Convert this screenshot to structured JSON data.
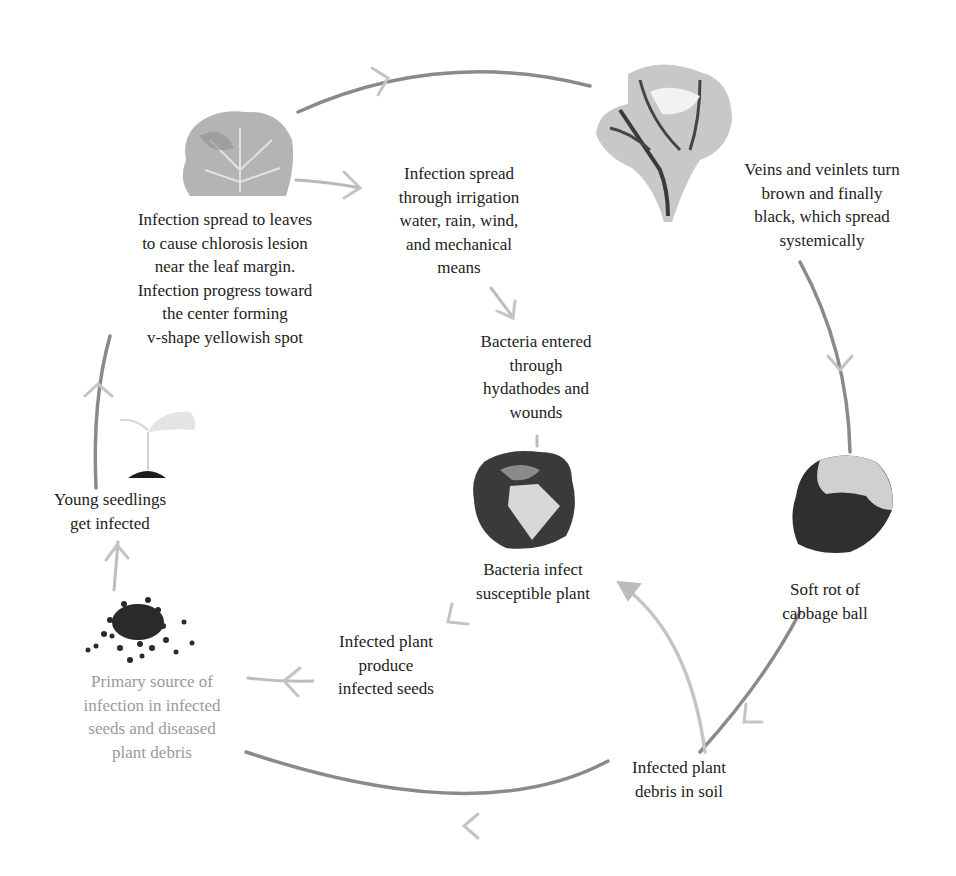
{
  "diagram": {
    "type": "disease-cycle",
    "colors": {
      "arrow_dark": "#7d7d7d",
      "arrow_light": "#bdbdbd",
      "text": "#222222",
      "text_faded": "#9a9a9a"
    },
    "nodes": [
      {
        "id": "leaf-chlorosis",
        "image": "leaf-icon",
        "lines": [
          "Infection spread to leaves",
          "to cause chlorosis lesion",
          "near the leaf margin.",
          "Infection progress toward",
          "the center forming",
          "v-shape yellowish spot"
        ]
      },
      {
        "id": "spread-means",
        "lines": [
          "Infection spread",
          "through irrigation",
          "water, rain, wind,",
          "and mechanical",
          "means"
        ]
      },
      {
        "id": "veins-black",
        "image": "blackened-leaf-icon",
        "lines": [
          "Veins and veinlets turn",
          "brown and finally",
          "black, which spread",
          "systemically"
        ]
      },
      {
        "id": "bacteria-entered",
        "lines": [
          "Bacteria entered",
          "through",
          "hydathodes and",
          "wounds"
        ]
      },
      {
        "id": "bacteria-infect",
        "image": "infected-cabbage-icon",
        "lines": [
          "Bacteria infect",
          "susceptible plant"
        ]
      },
      {
        "id": "soft-rot",
        "image": "rotten-cabbage-icon",
        "lines": [
          "Soft rot of",
          "cabbage ball"
        ]
      },
      {
        "id": "debris-soil",
        "lines": [
          "Infected plant",
          "debris in soil"
        ]
      },
      {
        "id": "infected-seeds",
        "lines": [
          "Infected plant",
          "produce",
          "infected seeds"
        ]
      },
      {
        "id": "primary-source",
        "image": "seeds-icon",
        "lines": [
          "Primary source of",
          "infection in infected",
          "seeds and diseased",
          "plant debris"
        ]
      },
      {
        "id": "young-seedlings",
        "image": "seedling-icon",
        "lines": [
          "Young seedlings",
          "get infected"
        ]
      }
    ]
  }
}
